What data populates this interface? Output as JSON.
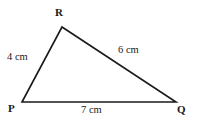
{
  "figure": {
    "type": "geometry-diagram",
    "shape": "triangle",
    "background_color": "#ffffff",
    "stroke_color": "#1a1a1a",
    "text_color": "#1a1a1a",
    "width": 197,
    "height": 121,
    "vertices": [
      {
        "name": "P",
        "label": "P",
        "x": 22,
        "y": 102
      },
      {
        "name": "Q",
        "label": "Q",
        "x": 176,
        "y": 102
      },
      {
        "name": "R",
        "label": "R",
        "x": 62,
        "y": 27
      }
    ],
    "sides": [
      {
        "name": "PR",
        "label": "4 cm",
        "value": 4,
        "unit": "cm",
        "from": "P",
        "to": "R"
      },
      {
        "name": "RQ",
        "label": "6 cm",
        "value": 6,
        "unit": "cm",
        "from": "R",
        "to": "Q"
      },
      {
        "name": "PQ",
        "label": "7 cm",
        "value": 7,
        "unit": "cm",
        "from": "P",
        "to": "Q"
      }
    ],
    "polygon_points": "22,102 62,27 176,102"
  }
}
